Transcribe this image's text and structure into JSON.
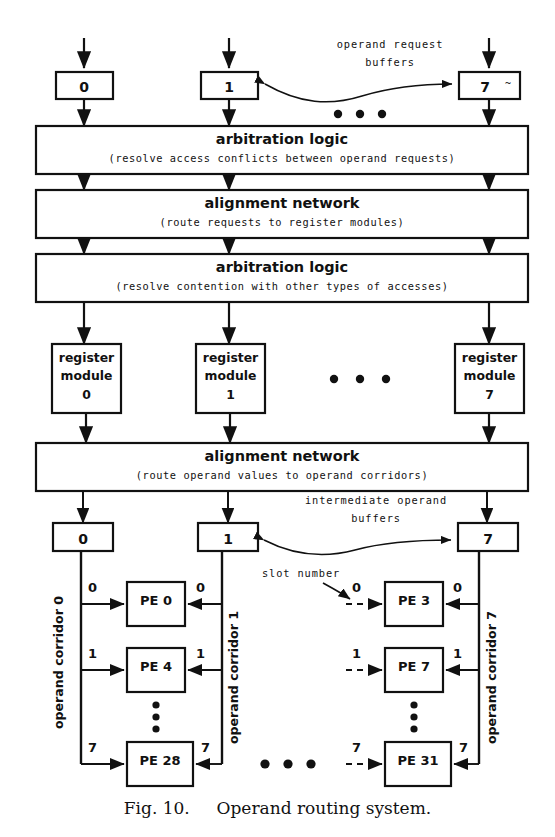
{
  "figure": {
    "caption_label": "Fig. 10.",
    "caption_text": "Operand routing system."
  },
  "request_buffers": {
    "annotation_line1": "operand request",
    "annotation_line2": "buffers",
    "items": [
      {
        "label": "0"
      },
      {
        "label": "1"
      },
      {
        "label": "7"
      }
    ],
    "ellipsis": "•  •  •"
  },
  "stages": [
    {
      "title": "arbitration logic",
      "subtitle": "(resolve access conflicts between operand requests)"
    },
    {
      "title": "alignment network",
      "subtitle": "(route requests to register modules)"
    },
    {
      "title": "arbitration logic",
      "subtitle": "(resolve contention with other types of accesses)"
    },
    {
      "title": "alignment network",
      "subtitle": "(route operand values to operand corridors)"
    }
  ],
  "register_modules": {
    "line1": "register",
    "line2": "module",
    "items": [
      {
        "index": "0"
      },
      {
        "index": "1"
      },
      {
        "index": "7"
      }
    ],
    "ellipsis": "•  •  •"
  },
  "intermediate_buffers": {
    "annotation_line1": "intermediate operand",
    "annotation_line2": "buffers",
    "items": [
      {
        "label": "0"
      },
      {
        "label": "1"
      },
      {
        "label": "7"
      }
    ]
  },
  "pe_section": {
    "slot_number_annotation": "slot number",
    "corridor_labels": [
      "operand corridor 0",
      "operand corridor 1",
      "operand corridor 7"
    ],
    "ellipsis": "•  •  •",
    "groups": [
      {
        "left_corridor": "operand corridor 0",
        "right_corridor": "operand corridor 1",
        "rows": [
          {
            "slot_left": "0",
            "pe": "PE 0",
            "slot_right": "0"
          },
          {
            "slot_left": "1",
            "pe": "PE 4",
            "slot_right": "1"
          },
          {
            "slot_left": "7",
            "pe": "PE 28",
            "slot_right": "7"
          }
        ],
        "vertical_ellipsis": "⋮"
      },
      {
        "left_corridor": "",
        "right_corridor": "operand corridor 7",
        "rows": [
          {
            "slot_left": "0",
            "pe": "PE 3",
            "slot_right": "0"
          },
          {
            "slot_left": "1",
            "pe": "PE 7",
            "slot_right": "1"
          },
          {
            "slot_left": "7",
            "pe": "PE 31",
            "slot_right": "7"
          }
        ],
        "vertical_ellipsis": "⋮"
      }
    ]
  }
}
